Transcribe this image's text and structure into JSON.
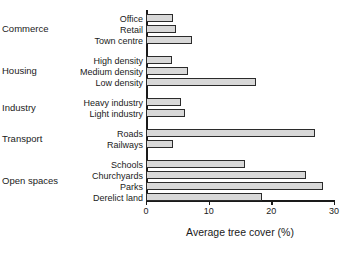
{
  "chart_data": {
    "type": "bar",
    "orientation": "horizontal",
    "title": "",
    "xlabel": "Average tree cover (%)",
    "ylabel": "",
    "xlim": [
      0,
      30
    ],
    "xticks": [
      0,
      10,
      20,
      30
    ],
    "xtick_labels": [
      "0",
      "10",
      "20",
      "30"
    ],
    "grid": false,
    "legend": false,
    "categories": [
      "Office",
      "Retail",
      "Town centre",
      "High density",
      "Medium density",
      "Low density",
      "Heavy industry",
      "Light industry",
      "Roads",
      "Railways",
      "Schools",
      "Churchyards",
      "Parks",
      "Derelict land"
    ],
    "values": [
      4.3,
      4.8,
      7.3,
      4.2,
      6.7,
      17.5,
      5.6,
      6.2,
      27.0,
      4.3,
      15.8,
      25.5,
      28.2,
      18.5
    ],
    "groups": [
      {
        "label": "Commerce",
        "categories": [
          "Office",
          "Retail",
          "Town centre"
        ]
      },
      {
        "label": "Housing",
        "categories": [
          "High density",
          "Medium density",
          "Low density"
        ]
      },
      {
        "label": "Industry",
        "categories": [
          "Heavy industry",
          "Light industry"
        ]
      },
      {
        "label": "Transport",
        "categories": [
          "Roads",
          "Railways"
        ]
      },
      {
        "label": "Open spaces",
        "categories": [
          "Schools",
          "Churchyards",
          "Parks",
          "Derelict land"
        ]
      }
    ],
    "bar_fill_color": "#d8d8d8",
    "bar_edge_color": "#2b2b2b",
    "axis_color": "#1a1a1a",
    "background_color": "#ffffff"
  }
}
